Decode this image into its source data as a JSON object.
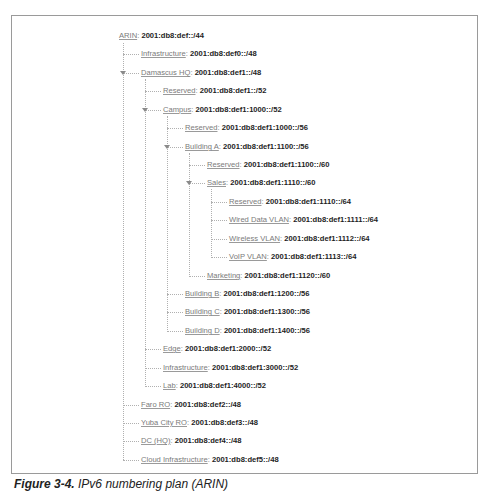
{
  "figure": {
    "caption_label": "Figure 3-4.",
    "caption_text": "IPv6 numbering plan (ARIN)"
  },
  "tree": {
    "separator": ":",
    "nodes": [
      {
        "id": "arin",
        "label": "ARIN",
        "prefix": "2001:db8:def::/44",
        "level": 0,
        "expanded": true
      },
      {
        "id": "infrastructure",
        "label": "Infrastructure",
        "prefix": "2001:db8:def0::/48",
        "level": 1
      },
      {
        "id": "damascus-hq",
        "label": "Damascus HQ",
        "prefix": "2001:db8:def1::/48",
        "level": 1,
        "expanded": true
      },
      {
        "id": "damascus-reserved",
        "label": "Reserved",
        "prefix": "2001:db8:def1::/52",
        "level": 2
      },
      {
        "id": "campus",
        "label": "Campus",
        "prefix": "2001:db8:def1:1000::/52",
        "level": 2,
        "expanded": true
      },
      {
        "id": "campus-reserved",
        "label": "Reserved",
        "prefix": "2001:db8:def1:1000::/56",
        "level": 3
      },
      {
        "id": "building-a",
        "label": "Building A",
        "prefix": "2001:db8:def1:1100::/56",
        "level": 3,
        "expanded": true
      },
      {
        "id": "building-a-reserved",
        "label": "Reserved",
        "prefix": "2001:db8:def1:1100::/60",
        "level": 4
      },
      {
        "id": "sales",
        "label": "Sales",
        "prefix": "2001:db8:def1:1110::/60",
        "level": 4,
        "expanded": true
      },
      {
        "id": "sales-reserved",
        "label": "Reserved",
        "prefix": "2001:db8:def1:1110::/64",
        "level": 5
      },
      {
        "id": "wired-data-vlan",
        "label": "Wired Data VLAN",
        "prefix": "2001:db8:def1:1111::/64",
        "level": 5
      },
      {
        "id": "wireless-vlan",
        "label": "Wireless VLAN",
        "prefix": "2001:db8:def1:1112::/64",
        "level": 5
      },
      {
        "id": "voip-vlan",
        "label": "VoIP VLAN",
        "prefix": "2001:db8:def1:1113::/64",
        "level": 5
      },
      {
        "id": "marketing",
        "label": "Marketing",
        "prefix": "2001:db8:def1:1120::/60",
        "level": 4
      },
      {
        "id": "building-b",
        "label": "Building B",
        "prefix": "2001:db8:def1:1200::/56",
        "level": 3
      },
      {
        "id": "building-c",
        "label": "Building C",
        "prefix": "2001:db8:def1:1300::/56",
        "level": 3
      },
      {
        "id": "building-d",
        "label": "Building D",
        "prefix": "2001:db8:def1:1400::/56",
        "level": 3
      },
      {
        "id": "edge",
        "label": "Edge",
        "prefix": "2001:db8:def1:2000::/52",
        "level": 2
      },
      {
        "id": "damascus-infrastructure",
        "label": "Infrastructure",
        "prefix": "2001:db8:def1:3000::/52",
        "level": 2
      },
      {
        "id": "lab",
        "label": "Lab",
        "prefix": "2001:db8:def1:4000::/52",
        "level": 2
      },
      {
        "id": "faro-ro",
        "label": "Faro RO",
        "prefix": "2001:db8:def2::/48",
        "level": 1
      },
      {
        "id": "yuba-city-ro",
        "label": "Yuba City RO",
        "prefix": "2001:db8:def3::/48",
        "level": 1
      },
      {
        "id": "dc-hq",
        "label": "DC (HQ)",
        "prefix": "2001:db8:def4::/48",
        "level": 1
      },
      {
        "id": "cloud-infrastructure",
        "label": "Cloud Infrastructure",
        "prefix": "2001:db8:def5::/48",
        "level": 1
      }
    ]
  },
  "colors": {
    "label": "#7a7a7a",
    "prefix": "#1e1e1e",
    "lines": "#b0b0b0",
    "frame_border": "#9a9a9a"
  }
}
